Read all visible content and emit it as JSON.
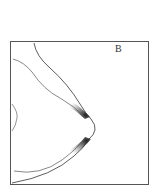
{
  "figure": {
    "panel_label": "B",
    "colors": {
      "background": "#ffffff",
      "frame": "#555555",
      "line": "#333333",
      "shading": "#1a1a1a"
    }
  }
}
